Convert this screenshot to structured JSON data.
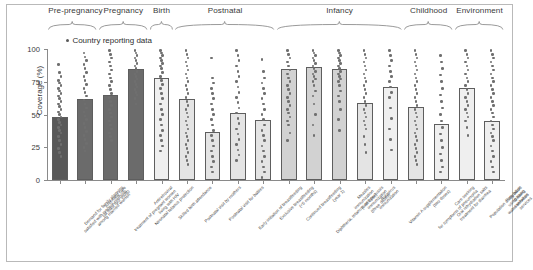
{
  "legend": {
    "label": "Country reporting data",
    "marker": "dot"
  },
  "axis": {
    "ylabel": "Coverage (%)",
    "yticks": [
      "0",
      "25",
      "50",
      "75",
      "100"
    ],
    "ymin": 0,
    "ymax": 100
  },
  "colors": {
    "dark": "#595959",
    "mid_dark": "#6b6b6b",
    "mid": "#9e9e9e",
    "light": "#d2d2d2",
    "lighter": "#e4e4e4",
    "pale": "#efefef",
    "dot": "#6f6f6f",
    "axis": "#8a8a8a",
    "frame": "#b9b9b9"
  },
  "groups": [
    {
      "name": "Pre-pregnancy",
      "first": 0,
      "last": 1
    },
    {
      "name": "Pregnancy",
      "first": 2,
      "last": 3
    },
    {
      "name": "Birth",
      "first": 4,
      "last": 4
    },
    {
      "name": "Postnatal",
      "first": 5,
      "last": 8
    },
    {
      "name": "Infancy",
      "first": 9,
      "last": 13
    },
    {
      "name": "Childhood",
      "first": 14,
      "last": 15
    },
    {
      "name": "Environment",
      "first": 16,
      "last": 17
    }
  ],
  "chart_data": {
    "type": "bar",
    "title": "",
    "xlabel": "",
    "ylabel": "Coverage (%)",
    "ylim": [
      0,
      100
    ],
    "grid": false,
    "legend_position": "top-left",
    "legend_entries": [
      "Country reporting data"
    ],
    "annotations": [
      "Pre-pregnancy",
      "Pregnancy",
      "Birth",
      "Postnatal",
      "Infancy",
      "Childhood",
      "Environment"
    ],
    "categories": [
      "Demand for family planning satisfied with modern methods among married women",
      "Antenatal care (at least four visits)",
      "Antiretroviral treatment of pregnant women living with HIV",
      "Neonatal tetanus protection",
      "Skilled birth attendance",
      "Postnatal visit by mothers",
      "Postnatal visit for babies",
      "Early initiation of breastfeeding",
      "Exclusive breastfeeding (<6 months)",
      "Continued breastfeeding (year 1)",
      "Diphtheria, tetanus, and pertussis immunization (three doses)",
      "Measles immunization (first dose)",
      "Rotavirus immunization",
      "Vitamin A supplementation (two doses)",
      "Care seeking for symptoms of pneumonia",
      "Oral rehydration salts treatment for diarrhea",
      "Population using basic drinking water services",
      "Population using basic sanitation services"
    ],
    "values": [
      48,
      62,
      65,
      85,
      78,
      62,
      37,
      51,
      46,
      85,
      86,
      85,
      59,
      71,
      56,
      43,
      70,
      45
    ],
    "series": [
      {
        "name": "Global coverage",
        "values": [
          48,
          62,
          65,
          85,
          78,
          62,
          37,
          51,
          46,
          85,
          86,
          85,
          59,
          71,
          56,
          43,
          70,
          45
        ]
      }
    ],
    "scatter_overlay": {
      "label": "Country reporting data",
      "description": "Vertical jittered dot columns of per-country coverage values drawn over each bar",
      "columns": [
        [
          88,
          82,
          79,
          76,
          74,
          72,
          70,
          68,
          66,
          64,
          62,
          60,
          58,
          56,
          54,
          52,
          50,
          48,
          46,
          44,
          42,
          40,
          38,
          36,
          33,
          30,
          27,
          24,
          21,
          18
        ],
        [
          97,
          94,
          91,
          88,
          85,
          82,
          79,
          76,
          73,
          70,
          67,
          64,
          61,
          58,
          55,
          52,
          49,
          46,
          43,
          40,
          37,
          34,
          31,
          28,
          25,
          22
        ],
        [
          99,
          96,
          93,
          90,
          87,
          84,
          81,
          78,
          75,
          72,
          69,
          66,
          63,
          60,
          57,
          54,
          51,
          48,
          45,
          42,
          39,
          36,
          33,
          30
        ],
        [
          99,
          97,
          95,
          93,
          91,
          89,
          87,
          85,
          83,
          81,
          79,
          77,
          75,
          73,
          71,
          69,
          67,
          65,
          62,
          58
        ],
        [
          99,
          97,
          95,
          93,
          91,
          89,
          87,
          85,
          82,
          79,
          76,
          73,
          70,
          66,
          62,
          58,
          54,
          50,
          46,
          42,
          38,
          34,
          30,
          26,
          22
        ],
        [
          99,
          96,
          93,
          90,
          87,
          84,
          81,
          78,
          75,
          72,
          69,
          66,
          63,
          60,
          57,
          54,
          51,
          48,
          45,
          42,
          39,
          36,
          33,
          30,
          27,
          24,
          21,
          18,
          15,
          12
        ],
        [
          93,
          78,
          74,
          70,
          66,
          62,
          58,
          54,
          50,
          46,
          42,
          38,
          34,
          30,
          26,
          22,
          18,
          14,
          10,
          6
        ],
        [
          99,
          95,
          91,
          87,
          83,
          79,
          75,
          71,
          67,
          63,
          59,
          55,
          51,
          47,
          43,
          39,
          35,
          31,
          27,
          23,
          19,
          15
        ],
        [
          92,
          83,
          78,
          74,
          70,
          66,
          62,
          58,
          54,
          50,
          46,
          42,
          38,
          34,
          30,
          26,
          22,
          18,
          14,
          10,
          6,
          2
        ],
        [
          99,
          96,
          93,
          90,
          87,
          84,
          81,
          78,
          75,
          72,
          69,
          66,
          63,
          60,
          57,
          54,
          51,
          48,
          45,
          42,
          36,
          30
        ],
        [
          99,
          97,
          95,
          93,
          91,
          89,
          87,
          85,
          83,
          81,
          79,
          77,
          75,
          72,
          68,
          64,
          58,
          50,
          42,
          34
        ],
        [
          99,
          97,
          95,
          93,
          91,
          89,
          87,
          85,
          83,
          81,
          79,
          77,
          75,
          72,
          68,
          64,
          60,
          54,
          46,
          38
        ],
        [
          99,
          96,
          93,
          90,
          87,
          84,
          81,
          78,
          75,
          72,
          69,
          66,
          63,
          60,
          57,
          54,
          51,
          48,
          45,
          42,
          39,
          33,
          27,
          21
        ],
        [
          99,
          95,
          91,
          87,
          83,
          79,
          75,
          71,
          67,
          63,
          55,
          47,
          39,
          31,
          23
        ],
        [
          99,
          96,
          93,
          90,
          87,
          84,
          81,
          78,
          75,
          72,
          69,
          66,
          63,
          60,
          57,
          54,
          51,
          48,
          45,
          42,
          39,
          36,
          33,
          30,
          27,
          24,
          21,
          18,
          15,
          12
        ],
        [
          95,
          90,
          85,
          80,
          75,
          70,
          65,
          60,
          55,
          50,
          45,
          40,
          35,
          30,
          25,
          20,
          15,
          10,
          6
        ],
        [
          99,
          96,
          93,
          90,
          87,
          84,
          81,
          78,
          75,
          72,
          69,
          66,
          63,
          60,
          57,
          54,
          51,
          48,
          45,
          40,
          34
        ],
        [
          99,
          96,
          93,
          90,
          87,
          84,
          81,
          78,
          75,
          72,
          69,
          66,
          63,
          60,
          57,
          54,
          51,
          48,
          45,
          42,
          39,
          36,
          33,
          30,
          26,
          22,
          18,
          14,
          10,
          6
        ]
      ]
    }
  }
}
